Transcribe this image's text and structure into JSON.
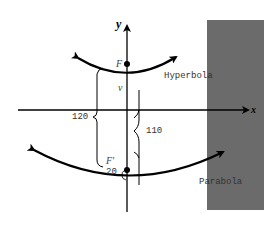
{
  "diagram": {
    "axes": {
      "x_label": "x",
      "y_label": "y"
    },
    "points": {
      "focus_top": "F",
      "vertex": "v",
      "focus_bottom": "F'"
    },
    "curves": {
      "hyperbola_label": "Hyperbola",
      "parabola_label": "Parabola"
    },
    "measurements": {
      "left_brace": "120",
      "right_brace": "110",
      "small_gap": "20"
    },
    "colors": {
      "stroke": "#000000",
      "shaded_region": "#6b6b6b",
      "label_text": "#333333"
    }
  }
}
